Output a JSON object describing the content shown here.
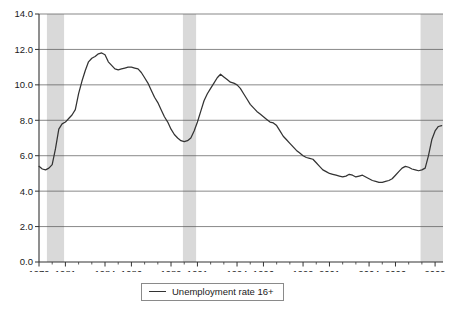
{
  "chart_data": {
    "type": "line",
    "title": "",
    "xlabel": "",
    "ylabel": "",
    "xlim": [
      1979.0,
      2009.6
    ],
    "ylim": [
      0.0,
      14.0
    ],
    "grid": true,
    "gridlines_axis": "y",
    "legend_position": "below-center",
    "legend": [
      "Unemployment rate 16+"
    ],
    "yticks": [
      "0.0",
      "2.0",
      "4.0",
      "6.0",
      "8.0",
      "10.0",
      "12.0",
      "14.0"
    ],
    "ytick_values": [
      0.0,
      2.0,
      4.0,
      6.0,
      8.0,
      10.0,
      12.0,
      14.0
    ],
    "xticks": [
      "1979",
      "1981",
      "1984",
      "1986",
      "1989",
      "1991",
      "1994",
      "1996",
      "1999",
      "2001",
      "2004",
      "2006",
      "2009"
    ],
    "xtick_values": [
      1979,
      1981,
      1984,
      1986,
      1989,
      1991,
      1994,
      1996,
      1999,
      2001,
      2004,
      2006,
      2009
    ],
    "line_color": "#333333",
    "shading_color": "#d9d9d9",
    "shaded_regions": [
      {
        "label": "recession",
        "x0": 1979.6,
        "x1": 1980.9
      },
      {
        "label": "recession",
        "x0": 1989.9,
        "x1": 1990.9
      },
      {
        "label": "recession",
        "x0": 2007.9,
        "x1": 2009.6
      }
    ],
    "series": [
      {
        "name": "Unemployment rate 16+",
        "x": [
          1979.0,
          1979.25,
          1979.5,
          1979.75,
          1980.0,
          1980.25,
          1980.5,
          1980.75,
          1981.0,
          1981.25,
          1981.5,
          1981.75,
          1982.0,
          1982.25,
          1982.5,
          1982.75,
          1983.0,
          1983.25,
          1983.5,
          1983.75,
          1984.0,
          1984.25,
          1984.5,
          1984.75,
          1985.0,
          1985.25,
          1985.5,
          1985.75,
          1986.0,
          1986.25,
          1986.5,
          1986.75,
          1987.0,
          1987.25,
          1987.5,
          1987.75,
          1988.0,
          1988.25,
          1988.5,
          1988.75,
          1989.0,
          1989.25,
          1989.5,
          1989.75,
          1990.0,
          1990.25,
          1990.5,
          1990.75,
          1991.0,
          1991.25,
          1991.5,
          1991.75,
          1992.0,
          1992.25,
          1992.5,
          1992.75,
          1993.0,
          1993.25,
          1993.5,
          1993.75,
          1994.0,
          1994.25,
          1994.5,
          1994.75,
          1995.0,
          1995.25,
          1995.5,
          1995.75,
          1996.0,
          1996.25,
          1996.5,
          1996.75,
          1997.0,
          1997.25,
          1997.5,
          1997.75,
          1998.0,
          1998.25,
          1998.5,
          1998.75,
          1999.0,
          1999.25,
          1999.5,
          1999.75,
          2000.0,
          2000.25,
          2000.5,
          2000.75,
          2001.0,
          2001.25,
          2001.5,
          2001.75,
          2002.0,
          2002.25,
          2002.5,
          2002.75,
          2003.0,
          2003.25,
          2003.5,
          2003.75,
          2004.0,
          2004.25,
          2004.5,
          2004.75,
          2005.0,
          2005.25,
          2005.5,
          2005.75,
          2006.0,
          2006.25,
          2006.5,
          2006.75,
          2007.0,
          2007.25,
          2007.5,
          2007.75,
          2008.0,
          2008.25,
          2008.5,
          2008.75,
          2009.0,
          2009.25,
          2009.5
        ],
        "values": [
          5.4,
          5.25,
          5.2,
          5.3,
          5.5,
          6.4,
          7.5,
          7.8,
          7.9,
          8.1,
          8.3,
          8.6,
          9.5,
          10.2,
          10.8,
          11.3,
          11.5,
          11.6,
          11.75,
          11.8,
          11.7,
          11.3,
          11.1,
          10.9,
          10.85,
          10.9,
          10.95,
          11.0,
          11.0,
          10.95,
          10.9,
          10.7,
          10.4,
          10.1,
          9.7,
          9.3,
          9.0,
          8.6,
          8.2,
          7.9,
          7.5,
          7.2,
          7.0,
          6.85,
          6.8,
          6.85,
          7.0,
          7.4,
          7.9,
          8.5,
          9.1,
          9.5,
          9.8,
          10.1,
          10.4,
          10.6,
          10.45,
          10.3,
          10.15,
          10.1,
          10.0,
          9.8,
          9.5,
          9.2,
          8.9,
          8.7,
          8.5,
          8.35,
          8.2,
          8.05,
          7.9,
          7.85,
          7.7,
          7.4,
          7.1,
          6.9,
          6.7,
          6.5,
          6.3,
          6.15,
          6.0,
          5.9,
          5.85,
          5.8,
          5.6,
          5.4,
          5.2,
          5.1,
          5.0,
          4.95,
          4.9,
          4.85,
          4.8,
          4.85,
          4.95,
          4.9,
          4.8,
          4.85,
          4.9,
          4.8,
          4.7,
          4.6,
          4.55,
          4.5,
          4.5,
          4.55,
          4.6,
          4.7,
          4.9,
          5.1,
          5.3,
          5.4,
          5.35,
          5.25,
          5.2,
          5.15,
          5.2,
          5.3,
          6.0,
          6.9,
          7.4,
          7.65,
          7.7
        ]
      }
    ]
  },
  "legend_entry": "Unemployment rate 16+"
}
